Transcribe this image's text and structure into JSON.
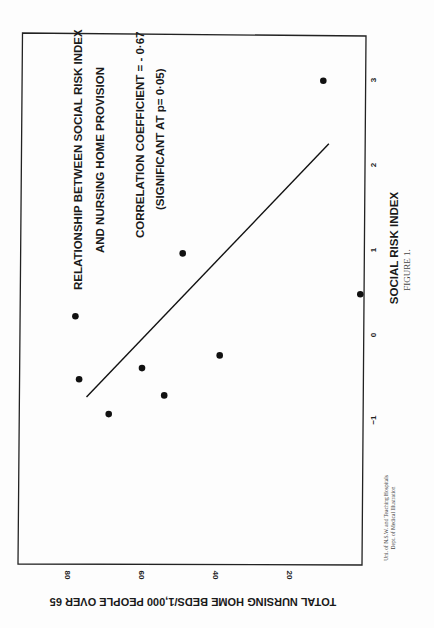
{
  "figure": {
    "label": "FIGURE 1.",
    "credit_line1": "Uni. of N.S.W. and Teaching Hospitals",
    "credit_line2": "Dept. of Medical Illustration",
    "orientation": "rotated 90° clockwise on page"
  },
  "annotations": {
    "title_line1": "RELATIONSHIP BETWEEN SOCIAL RISK INDEX",
    "title_line2": "AND NURSING HOME PROVISION",
    "stat_line1": "CORRELATION  COEFFICIENT = - 0·67",
    "stat_line2": "(SIGNIFICANT AT p= 0·05)"
  },
  "chart_data": {
    "type": "scatter",
    "title": "RELATIONSHIP BETWEEN SOCIAL RISK INDEX AND NURSING HOME PROVISION",
    "subtitle": "CORRELATION COEFFICIENT = -0·67 (SIGNIFICANT AT p= 0·05)",
    "xlabel": "SOCIAL RISK INDEX",
    "ylabel": "TOTAL NURSING HOME BEDS/1,000 PEOPLE OVER 65",
    "x_ticks": [
      "-1",
      "0",
      "1",
      "2",
      "3"
    ],
    "y_ticks": [
      "20",
      "40",
      "60",
      "80"
    ],
    "xlim": [
      -1.7,
      3.5
    ],
    "ylim": [
      0,
      93
    ],
    "grid": false,
    "legend": "none",
    "series": [
      {
        "name": "Regions",
        "points": [
          {
            "x": -0.93,
            "y": 69
          },
          {
            "x": -0.71,
            "y": 54
          },
          {
            "x": -0.52,
            "y": 77
          },
          {
            "x": -0.39,
            "y": 60
          },
          {
            "x": -0.24,
            "y": 39
          },
          {
            "x": 0.22,
            "y": 78
          },
          {
            "x": 0.48,
            "y": 1
          },
          {
            "x": 0.96,
            "y": 49
          },
          {
            "x": 2.99,
            "y": 11
          }
        ]
      }
    ],
    "regression_line": {
      "x_start": -0.73,
      "y_start": 75,
      "x_end": 2.25,
      "y_end": 9.5
    },
    "correlation": -0.67,
    "significance": "p = 0.05"
  }
}
